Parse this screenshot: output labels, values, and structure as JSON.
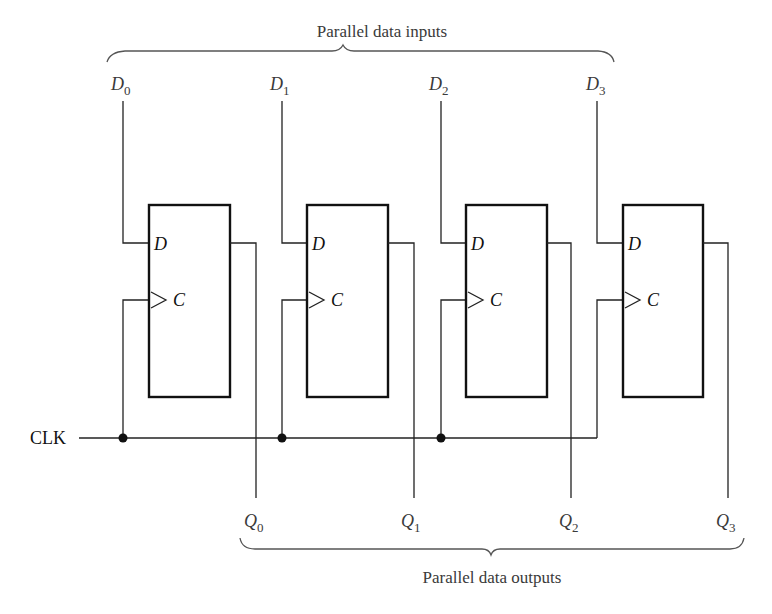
{
  "title_inputs": "Parallel data inputs",
  "title_outputs": "Parallel data outputs",
  "clock_label": "CLK",
  "flipflops": [
    {
      "input_label": "D",
      "input_sub": "0",
      "output_label": "Q",
      "output_sub": "0",
      "pin_d": "D",
      "pin_c": "C"
    },
    {
      "input_label": "D",
      "input_sub": "1",
      "output_label": "Q",
      "output_sub": "1",
      "pin_d": "D",
      "pin_c": "C"
    },
    {
      "input_label": "D",
      "input_sub": "2",
      "output_label": "Q",
      "output_sub": "2",
      "pin_d": "D",
      "pin_c": "C"
    },
    {
      "input_label": "D",
      "input_sub": "3",
      "output_label": "Q",
      "output_sub": "3",
      "pin_d": "D",
      "pin_c": "C"
    }
  ]
}
